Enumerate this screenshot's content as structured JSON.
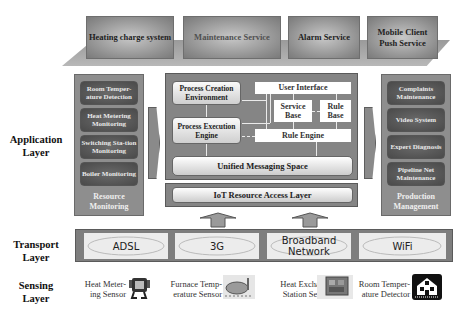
{
  "services": [
    {
      "label": "Heating charge system"
    },
    {
      "label": "Maintenance Service"
    },
    {
      "label": "Alarm Service"
    },
    {
      "label": "Mobile Client Push Service"
    }
  ],
  "layers": {
    "application": "Application Layer",
    "transport": "Transport Layer",
    "sensing": "Sensing Layer"
  },
  "resource_monitoring": {
    "caption": "Resource Monitoring",
    "items": [
      "Room Temper-ature Detection",
      "Heat Metering Monitoring",
      "Switching Sta-tion Monitoring",
      "Boiler Monitoring"
    ]
  },
  "production_management": {
    "caption": "Production Management",
    "items": [
      "Complaints Maintenance",
      "Video System",
      "Expert Diagnosis",
      "Pipeline Net Maintenance"
    ]
  },
  "core": {
    "process_creation": "Process Creation Environment",
    "process_execution": "Process Execution Engine",
    "user_interface": "User Interface",
    "service_base": "Service Base",
    "rule_base": "Rule Base",
    "rule_engine": "Rule Engine",
    "unified_messaging": "Unified Messaging Space",
    "iot_access": "IoT Resource Access Layer"
  },
  "networks": [
    "ADSL",
    "3G",
    "Broadband Network",
    "WiFi"
  ],
  "sensors": [
    {
      "label": "Heat Meter-ing Sensor",
      "icon": "heat-meter-icon"
    },
    {
      "label": "Furnace Temp-erature Sensor",
      "icon": "furnace-icon"
    },
    {
      "label": "Heat Exchange Station Sensor",
      "icon": "exchange-station-icon"
    },
    {
      "label": "Room Temper-ature Detector",
      "icon": "house-icon"
    }
  ]
}
